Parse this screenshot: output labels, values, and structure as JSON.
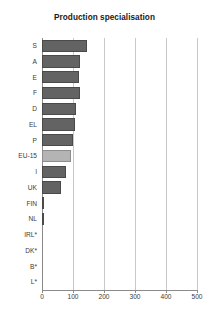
{
  "chart_data": {
    "type": "bar",
    "orientation": "horizontal",
    "title": "Production specialisation",
    "xlabel": "",
    "ylabel": "",
    "xlim": [
      0,
      500
    ],
    "xticks": [
      0,
      100,
      200,
      300,
      400,
      500
    ],
    "xtick_labels": [
      "0",
      "100",
      "200",
      "300",
      "400",
      "500"
    ],
    "grid": true,
    "grid_axis": "x",
    "legend": false,
    "categories": [
      "S",
      "A",
      "E",
      "F",
      "D",
      "EL",
      "P",
      "EU-15",
      "I",
      "UK",
      "FIN",
      "NL",
      "IRL*",
      "DK*",
      "B*",
      "L*"
    ],
    "values": [
      145,
      122,
      118,
      122,
      110,
      105,
      100,
      95,
      78,
      62,
      7,
      5,
      0,
      0,
      0,
      0
    ],
    "highlight_category": "EU-15",
    "colors": {
      "bar": "#636363",
      "bar_border": "#4a4a4a",
      "bar_highlight": "#b4b4b4",
      "bar_highlight_border": "#8d8d8d",
      "grid": "#c8c8c8",
      "axis": "#8a8a8a",
      "text": "#3a3a3a",
      "title": "#1a1a1a",
      "background": "#ffffff"
    }
  }
}
